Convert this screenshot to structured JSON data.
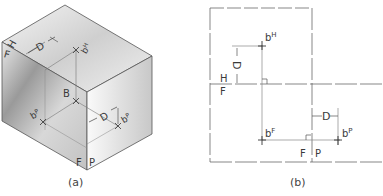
{
  "figure_a": {
    "caption": "(a)",
    "labels": {
      "top_left_H": "H",
      "top_left_F": "F",
      "depth_top": "D",
      "point_top": "b",
      "point_top_sup": "H",
      "point_B": "B",
      "point_left": "b",
      "point_left_sup": "P",
      "depth_front": "D",
      "point_right": "b",
      "point_right_sup": "P",
      "bottom_F": "F",
      "bottom_P": "P"
    }
  },
  "figure_b": {
    "caption": "(b)",
    "labels": {
      "point_H": "b",
      "point_H_sup": "H",
      "depth_vertical": "D",
      "fold_H": "H",
      "fold_F": "F",
      "point_F": "b",
      "point_F_sup": "F",
      "depth_horizontal": "D",
      "point_P": "b",
      "point_P_sup": "P",
      "fold_F2": "F",
      "fold_P": "P"
    }
  }
}
